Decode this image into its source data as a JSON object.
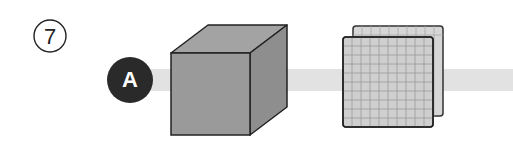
{
  "figure": {
    "problem_number": "⑦",
    "marker_label": "A",
    "objects": [
      {
        "name": "solid-cube",
        "description": "gray cube"
      },
      {
        "name": "grid-plates",
        "description": "two stacked grid plates (10x10)"
      }
    ],
    "colors": {
      "marker_fill": "#2a2a2a",
      "beam": "#e2e2e2",
      "cube_front": "#9a9a9a",
      "cube_top": "#a3a3a3",
      "cube_side": "#8e8e8e",
      "plate_fill": "#cfcfcf",
      "plate_grid": "#9a9a9a",
      "outline": "#222222"
    },
    "grid_divisions": 10
  }
}
